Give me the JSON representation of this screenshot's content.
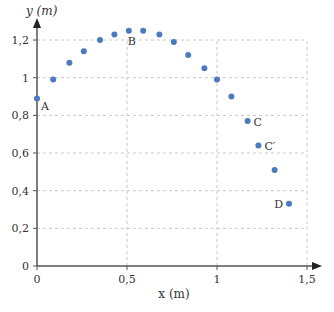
{
  "chart_data": {
    "type": "scatter",
    "title": "",
    "xlabel": "x (m)",
    "ylabel": "y (m)",
    "xlim": [
      0,
      1.5
    ],
    "ylim": [
      0,
      1.2
    ],
    "grid": true,
    "x_ticks": [
      "0",
      "0,5",
      "1",
      "1,5"
    ],
    "y_ticks": [
      "0",
      "0,2",
      "0,4",
      "0,6",
      "0,8",
      "1",
      "1,2"
    ],
    "points": [
      {
        "x": 0.0,
        "y": 0.89,
        "label": "A"
      },
      {
        "x": 0.09,
        "y": 0.99,
        "label": ""
      },
      {
        "x": 0.18,
        "y": 1.08,
        "label": ""
      },
      {
        "x": 0.26,
        "y": 1.14,
        "label": ""
      },
      {
        "x": 0.35,
        "y": 1.2,
        "label": ""
      },
      {
        "x": 0.43,
        "y": 1.23,
        "label": ""
      },
      {
        "x": 0.51,
        "y": 1.25,
        "label": "B"
      },
      {
        "x": 0.59,
        "y": 1.25,
        "label": ""
      },
      {
        "x": 0.68,
        "y": 1.23,
        "label": ""
      },
      {
        "x": 0.76,
        "y": 1.19,
        "label": ""
      },
      {
        "x": 0.84,
        "y": 1.12,
        "label": ""
      },
      {
        "x": 0.93,
        "y": 1.05,
        "label": ""
      },
      {
        "x": 1.0,
        "y": 0.99,
        "label": ""
      },
      {
        "x": 1.08,
        "y": 0.9,
        "label": ""
      },
      {
        "x": 1.17,
        "y": 0.77,
        "label": "C"
      },
      {
        "x": 1.23,
        "y": 0.64,
        "label": "C′"
      },
      {
        "x": 1.32,
        "y": 0.51,
        "label": ""
      },
      {
        "x": 1.4,
        "y": 0.33,
        "label": "D"
      }
    ],
    "point_color": "#4a7bbf"
  }
}
